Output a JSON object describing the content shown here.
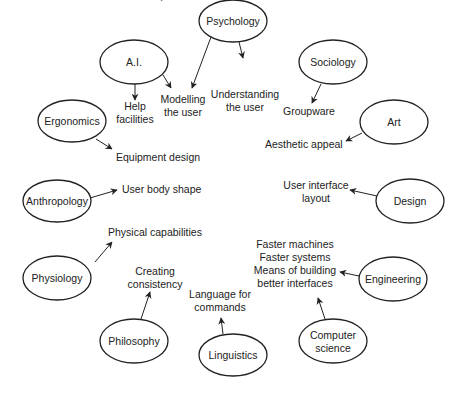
{
  "diagram": {
    "type": "radial-concept-map",
    "colors": {
      "stroke": "#222222",
      "text": "#222222",
      "background": "#ffffff"
    },
    "disciplines": [
      {
        "id": "psychology",
        "label": "Psychology",
        "lines": [
          "Psychology"
        ],
        "cx": 233,
        "cy": 21,
        "rx": 34,
        "ry": 21
      },
      {
        "id": "ai",
        "label": "A.I.",
        "lines": [
          "A.I."
        ],
        "cx": 134,
        "cy": 62,
        "rx": 34,
        "ry": 22
      },
      {
        "id": "sociology",
        "label": "Sociology",
        "lines": [
          "Sociology"
        ],
        "cx": 333,
        "cy": 62,
        "rx": 34,
        "ry": 22
      },
      {
        "id": "ergonomics",
        "label": "Ergonomics",
        "lines": [
          "Ergonomics"
        ],
        "cx": 72,
        "cy": 121,
        "rx": 34,
        "ry": 21
      },
      {
        "id": "art",
        "label": "Art",
        "lines": [
          "Art"
        ],
        "cx": 394,
        "cy": 122,
        "rx": 34,
        "ry": 22
      },
      {
        "id": "anthropology",
        "label": "Anthropology",
        "lines": [
          "Anthropology"
        ],
        "cx": 57,
        "cy": 201,
        "rx": 34,
        "ry": 21
      },
      {
        "id": "design",
        "label": "Design",
        "lines": [
          "Design"
        ],
        "cx": 410,
        "cy": 201,
        "rx": 34,
        "ry": 22
      },
      {
        "id": "physiology",
        "label": "Physiology",
        "lines": [
          "Physiology"
        ],
        "cx": 57,
        "cy": 278,
        "rx": 34,
        "ry": 22
      },
      {
        "id": "engineering",
        "label": "Engineering",
        "lines": [
          "Engineering"
        ],
        "cx": 393,
        "cy": 279,
        "rx": 34,
        "ry": 22
      },
      {
        "id": "philosophy",
        "label": "Philosophy",
        "lines": [
          "Philosophy"
        ],
        "cx": 134,
        "cy": 341,
        "rx": 34,
        "ry": 22
      },
      {
        "id": "linguistics",
        "label": "Linguistics",
        "lines": [
          "Linguistics"
        ],
        "cx": 233,
        "cy": 355,
        "rx": 34,
        "ry": 21
      },
      {
        "id": "computer-science",
        "label": "Computer science",
        "lines": [
          "Computer",
          "science"
        ],
        "cx": 333,
        "cy": 341,
        "rx": 34,
        "ry": 22
      }
    ],
    "contributions": [
      {
        "id": "help-facilities",
        "lines": [
          "Help",
          "facilities"
        ],
        "x": 135,
        "y": 110,
        "anchor": "middle"
      },
      {
        "id": "modelling-the-user",
        "lines": [
          "Modelling",
          "the user"
        ],
        "x": 183,
        "y": 103,
        "anchor": "middle"
      },
      {
        "id": "understanding-the-user",
        "lines": [
          "Understanding",
          "the user"
        ],
        "x": 245,
        "y": 98,
        "anchor": "middle"
      },
      {
        "id": "groupware",
        "lines": [
          "Groupware"
        ],
        "x": 309,
        "y": 115,
        "anchor": "middle"
      },
      {
        "id": "equipment-design",
        "lines": [
          "Equipment design"
        ],
        "x": 116,
        "y": 161,
        "anchor": "start"
      },
      {
        "id": "aesthetic-appeal",
        "lines": [
          "Aesthetic appeal"
        ],
        "x": 265,
        "y": 148,
        "anchor": "start"
      },
      {
        "id": "user-body-shape",
        "lines": [
          "User body shape"
        ],
        "x": 122,
        "y": 193,
        "anchor": "start"
      },
      {
        "id": "user-interface-layout",
        "lines": [
          "User interface",
          "layout"
        ],
        "x": 316,
        "y": 189,
        "anchor": "middle"
      },
      {
        "id": "physical-capabilities",
        "lines": [
          "Physical capabilities"
        ],
        "x": 108,
        "y": 236,
        "anchor": "start"
      },
      {
        "id": "creating-consistency",
        "lines": [
          "Creating",
          "consistency"
        ],
        "x": 155,
        "y": 275,
        "anchor": "middle"
      },
      {
        "id": "engineering-outputs",
        "lines": [
          "Faster machines",
          "Faster systems",
          "Means of building",
          "better interfaces"
        ],
        "x": 295,
        "y": 248,
        "anchor": "middle"
      },
      {
        "id": "language-for-commands",
        "lines": [
          "Language for",
          "commands"
        ],
        "x": 220,
        "y": 298,
        "anchor": "middle"
      }
    ],
    "arrows": [
      {
        "from": "ai",
        "to": "help-facilities",
        "x1": 135,
        "y1": 84,
        "x2": 135,
        "y2": 100
      },
      {
        "from": "ai",
        "to": "modelling-the-user",
        "x1": 163,
        "y1": 75,
        "x2": 171,
        "y2": 88
      },
      {
        "from": "psychology",
        "to": "modelling-the-user",
        "x1": 211,
        "y1": 37,
        "x2": 192,
        "y2": 88
      },
      {
        "from": "psychology",
        "to": "understanding-the-user",
        "x1": 239,
        "y1": 42,
        "x2": 243,
        "y2": 58
      },
      {
        "from": "sociology",
        "to": "groupware",
        "x1": 321,
        "y1": 84,
        "x2": 312,
        "y2": 103
      },
      {
        "from": "ergonomics",
        "to": "equipment-design",
        "x1": 96,
        "y1": 139,
        "x2": 112,
        "y2": 149
      },
      {
        "from": "art",
        "to": "aesthetic-appeal",
        "x1": 362,
        "y1": 133,
        "x2": 346,
        "y2": 141
      },
      {
        "from": "anthropology",
        "to": "user-body-shape",
        "x1": 90,
        "y1": 198,
        "x2": 117,
        "y2": 190
      },
      {
        "from": "design",
        "to": "user-interface-layout",
        "x1": 377,
        "y1": 196,
        "x2": 350,
        "y2": 190
      },
      {
        "from": "physiology",
        "to": "physical-capabilities",
        "x1": 95,
        "y1": 262,
        "x2": 112,
        "y2": 242
      },
      {
        "from": "philosophy",
        "to": "creating-consistency",
        "x1": 141,
        "y1": 319,
        "x2": 150,
        "y2": 292
      },
      {
        "from": "linguistics",
        "to": "language-for-commands",
        "x1": 223,
        "y1": 334,
        "x2": 221,
        "y2": 318
      },
      {
        "from": "engineering",
        "to": "engineering-outputs",
        "x1": 359,
        "y1": 276,
        "x2": 340,
        "y2": 272
      },
      {
        "from": "computer-science",
        "to": "engineering-outputs",
        "x1": 325,
        "y1": 319,
        "x2": 318,
        "y2": 298
      }
    ]
  }
}
